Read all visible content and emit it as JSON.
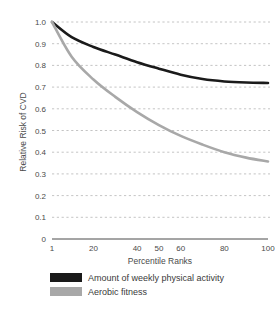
{
  "chart_data": {
    "type": "line",
    "title": "",
    "xlabel": "Percentile Ranks",
    "ylabel": "Relative Risk of CVD",
    "xlim": [
      1,
      100
    ],
    "ylim": [
      0,
      1.0
    ],
    "xticks": [
      1,
      20,
      40,
      50,
      60,
      80,
      100
    ],
    "xtick_labels": [
      "1",
      "20",
      "40",
      "50",
      "60",
      "80",
      "100"
    ],
    "yticks": [
      0,
      0.1,
      0.2,
      0.3,
      0.4,
      0.5,
      0.6,
      0.7,
      0.8,
      0.9,
      1.0
    ],
    "ytick_labels": [
      "0",
      "0.1",
      "0.2",
      "0.3",
      "0.4",
      "0.5",
      "0.6",
      "0.7",
      "0.8",
      "0.9",
      "1.0"
    ],
    "grid": true,
    "grid_style": "dotted-horizontal",
    "legend_position": "bottom-left",
    "series": [
      {
        "name": "Amount of weekly physical activity",
        "color": "#1a1a1a",
        "x": [
          1,
          10,
          20,
          30,
          40,
          50,
          60,
          70,
          80,
          90,
          100
        ],
        "values": [
          1.0,
          0.93,
          0.885,
          0.85,
          0.815,
          0.785,
          0.757,
          0.737,
          0.726,
          0.721,
          0.719
        ]
      },
      {
        "name": "Aerobic fitness",
        "color": "#a8a8a8",
        "x": [
          1,
          10,
          20,
          30,
          40,
          50,
          60,
          70,
          80,
          90,
          100
        ],
        "values": [
          1.0,
          0.84,
          0.735,
          0.655,
          0.585,
          0.525,
          0.475,
          0.435,
          0.4,
          0.375,
          0.357
        ]
      }
    ]
  },
  "legend": {
    "items": [
      {
        "label": "Amount of weekly physical activity",
        "color": "#1a1a1a"
      },
      {
        "label": "Aerobic fitness",
        "color": "#a8a8a8"
      }
    ]
  },
  "colors": {
    "background": "#ffffff",
    "axis": "#4a4a4a",
    "grid": "#b5b5b5",
    "series_black": "#1a1a1a",
    "series_gray": "#a8a8a8"
  }
}
